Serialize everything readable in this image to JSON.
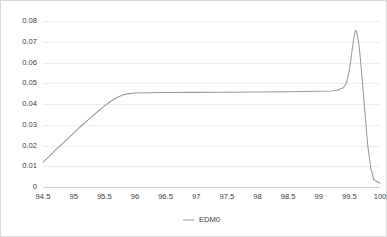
{
  "chart_data": {
    "type": "line",
    "title": "",
    "subtitle": "",
    "xlabel": "",
    "ylabel": "",
    "xlim": [
      94.5,
      100.0
    ],
    "ylim": [
      0,
      0.08
    ],
    "grid": true,
    "legend_position": "bottom",
    "x_ticks": [
      "94.5",
      "95",
      "95.5",
      "96",
      "96.5",
      "97",
      "97.5",
      "98",
      "98.5",
      "99",
      "99.5",
      "100"
    ],
    "x_tick_values": [
      94.5,
      95,
      95.5,
      96,
      96.5,
      97,
      97.5,
      98,
      98.5,
      99,
      99.5,
      100
    ],
    "y_ticks": [
      "0.08",
      "0.07",
      "0.06",
      "0.05",
      "0.04",
      "0.03",
      "0.02",
      "0.01",
      "0"
    ],
    "y_tick_values": [
      0.08,
      0.07,
      0.06,
      0.05,
      0.04,
      0.03,
      0.02,
      0.01,
      0
    ],
    "series": [
      {
        "name": "EDM0",
        "color": "#9a9a9a",
        "x": [
          94.5,
          94.6,
          94.7,
          94.8,
          94.9,
          95.0,
          95.1,
          95.2,
          95.3,
          95.4,
          95.5,
          95.6,
          95.7,
          95.8,
          95.9,
          96.0,
          96.2,
          96.5,
          97.0,
          97.5,
          98.0,
          98.5,
          99.0,
          99.2,
          99.3,
          99.4,
          99.45,
          99.5,
          99.54,
          99.58,
          99.6,
          99.62,
          99.65,
          99.68,
          99.72,
          99.76,
          99.8,
          99.85,
          99.9,
          100.0
        ],
        "y": [
          0.012,
          0.0148,
          0.0176,
          0.0204,
          0.0232,
          0.026,
          0.0288,
          0.0314,
          0.034,
          0.0365,
          0.039,
          0.0412,
          0.043,
          0.0443,
          0.045,
          0.0453,
          0.0454,
          0.0455,
          0.0456,
          0.0457,
          0.0458,
          0.0459,
          0.0461,
          0.0463,
          0.0466,
          0.0478,
          0.05,
          0.056,
          0.065,
          0.073,
          0.0755,
          0.0748,
          0.07,
          0.062,
          0.048,
          0.034,
          0.02,
          0.009,
          0.0035,
          0.0018
        ]
      }
    ]
  },
  "legend": [
    {
      "label": "EDM0",
      "color": "#9a9a9a"
    }
  ],
  "colors": {
    "line": "#9a9a9a",
    "grid": "#ededed",
    "baseline": "#cfcfcf",
    "text": "#3c3c3c",
    "border": "#d9d9d9",
    "background": "#ffffff"
  }
}
